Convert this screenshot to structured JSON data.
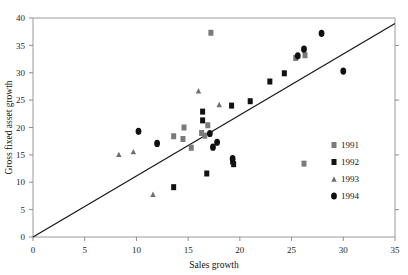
{
  "figure": {
    "background_color": "#ffffff",
    "frame_color": "#9a9a9a"
  },
  "axes": {
    "x_title": "Sales growth",
    "y_title": "Gross fixed asset growth",
    "x_ticks": [
      "0",
      "5",
      "10",
      "15",
      "20",
      "25",
      "30",
      "35"
    ],
    "y_ticks": [
      "0",
      "5",
      "10",
      "15",
      "20",
      "25",
      "30",
      "35",
      "40"
    ]
  },
  "legend": {
    "entries": [
      {
        "label": "1991",
        "marker": "square",
        "color": "#7a7a7a"
      },
      {
        "label": "1992",
        "marker": "square",
        "color": "#121212"
      },
      {
        "label": "1993",
        "marker": "triangle",
        "color": "#6f6f6f"
      },
      {
        "label": "1994",
        "marker": "circle",
        "color": "#101010"
      }
    ]
  },
  "chart_data": {
    "type": "scatter",
    "title": "",
    "xlabel": "Sales growth",
    "ylabel": "Gross fixed asset growth",
    "xlim": [
      0,
      35
    ],
    "ylim": [
      0,
      40
    ],
    "xticks": [
      0,
      5,
      10,
      15,
      20,
      25,
      30,
      35
    ],
    "yticks": [
      0,
      5,
      10,
      15,
      20,
      25,
      30,
      35,
      40
    ],
    "grid": false,
    "legend_position": "right",
    "reference_line": {
      "label": "45-degree line",
      "from": [
        0,
        0
      ],
      "to": [
        35,
        39
      ],
      "color": "#16161a"
    },
    "series": [
      {
        "name": "1991",
        "marker": "square",
        "color": "#7a7a7a",
        "points": [
          [
            17.2,
            37.3
          ],
          [
            26.3,
            33.2
          ],
          [
            25.4,
            32.7
          ],
          [
            14.6,
            20.0
          ],
          [
            16.9,
            20.4
          ],
          [
            14.5,
            17.9
          ],
          [
            16.6,
            18.5
          ],
          [
            15.3,
            16.3
          ],
          [
            13.6,
            18.4
          ],
          [
            16.3,
            19.0
          ],
          [
            26.2,
            13.4
          ]
        ]
      },
      {
        "name": "1992",
        "marker": "square",
        "color": "#121212",
        "points": [
          [
            24.3,
            29.9
          ],
          [
            22.9,
            28.4
          ],
          [
            21.0,
            24.8
          ],
          [
            16.4,
            22.9
          ],
          [
            16.4,
            21.3
          ],
          [
            19.2,
            24.0
          ],
          [
            16.8,
            11.6
          ],
          [
            13.6,
            9.1
          ],
          [
            19.3,
            13.8
          ],
          [
            19.4,
            13.3
          ]
        ]
      },
      {
        "name": "1993",
        "marker": "triangle",
        "color": "#6f6f6f",
        "points": [
          [
            16.0,
            26.7
          ],
          [
            18.0,
            24.2
          ],
          [
            8.3,
            15.1
          ],
          [
            9.7,
            15.6
          ],
          [
            11.6,
            7.8
          ]
        ]
      },
      {
        "name": "1994",
        "marker": "circle",
        "color": "#101010",
        "points": [
          [
            27.9,
            37.2
          ],
          [
            26.2,
            34.3
          ],
          [
            25.6,
            33.1
          ],
          [
            30.0,
            30.3
          ],
          [
            10.2,
            19.3
          ],
          [
            12.0,
            17.1
          ],
          [
            17.8,
            17.3
          ],
          [
            17.1,
            18.9
          ],
          [
            17.4,
            16.4
          ],
          [
            19.3,
            14.3
          ]
        ]
      }
    ]
  }
}
